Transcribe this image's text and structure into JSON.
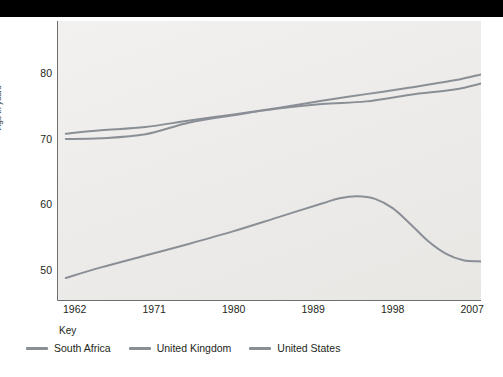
{
  "top_band": {
    "color": "#000000"
  },
  "chart_data": {
    "type": "line",
    "title": "",
    "xlabel": "",
    "ylabel": "Age in years",
    "xlim": [
      1960,
      2008
    ],
    "ylim": [
      45.5,
      88
    ],
    "grid": false,
    "legend_position": "bottom",
    "legend_title": "Key",
    "x_ticks": [
      1962,
      1971,
      1980,
      1989,
      1998,
      2007
    ],
    "y_ticks": [
      50,
      60,
      70,
      80
    ],
    "series": [
      {
        "name": "South Africa",
        "color": "#8a8f96",
        "x": [
          1961,
          1965,
          1970,
          1975,
          1980,
          1985,
          1990,
          1992,
          1994,
          1996,
          1998,
          2000,
          2002,
          2004,
          2006,
          2008
        ],
        "values": [
          49.0,
          50.6,
          52.4,
          54.2,
          56.1,
          58.2,
          60.3,
          61.1,
          61.4,
          61.0,
          59.6,
          57.2,
          54.6,
          52.7,
          51.7,
          51.5
        ]
      },
      {
        "name": "United Kingdom",
        "color": "#8a8f96",
        "x": [
          1961,
          1965,
          1970,
          1975,
          1980,
          1985,
          1990,
          1995,
          2000,
          2005,
          2008
        ],
        "values": [
          70.9,
          71.4,
          71.9,
          72.9,
          73.8,
          74.8,
          75.9,
          76.9,
          77.9,
          79.0,
          79.9
        ]
      },
      {
        "name": "United States",
        "color": "#8a8f96",
        "x": [
          1961,
          1965,
          1970,
          1975,
          1980,
          1985,
          1990,
          1995,
          2000,
          2005,
          2008
        ],
        "values": [
          70.1,
          70.2,
          70.8,
          72.6,
          73.7,
          74.7,
          75.4,
          75.8,
          76.8,
          77.6,
          78.5
        ]
      }
    ]
  }
}
